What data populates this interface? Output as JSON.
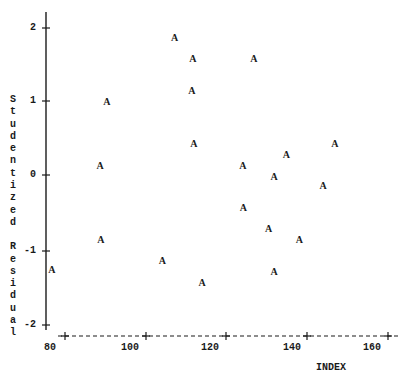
{
  "chart_data": {
    "type": "scatter",
    "title": "",
    "xlabel": "INDEX",
    "ylabel": "Studentized Residual",
    "xlim": [
      80,
      162
    ],
    "ylim": [
      -2,
      2.2
    ],
    "xticks": [
      "80",
      "100",
      "120",
      "140",
      "160"
    ],
    "yticks": [
      "2",
      "1",
      "0",
      "-1",
      "-2"
    ],
    "marker": "A",
    "grid": false,
    "legend": null,
    "series": [
      {
        "name": "A",
        "points": [
          {
            "x": 80.7,
            "y": -1.26
          },
          {
            "x": 92.6,
            "y": 0.13
          },
          {
            "x": 92.8,
            "y": -0.86
          },
          {
            "x": 94.3,
            "y": 1.0
          },
          {
            "x": 108.0,
            "y": -1.15
          },
          {
            "x": 111.0,
            "y": 1.86
          },
          {
            "x": 115.3,
            "y": 1.15
          },
          {
            "x": 115.5,
            "y": 1.58
          },
          {
            "x": 115.8,
            "y": 0.43
          },
          {
            "x": 117.8,
            "y": -1.44
          },
          {
            "x": 127.9,
            "y": 0.14
          },
          {
            "x": 128.0,
            "y": -0.43
          },
          {
            "x": 130.6,
            "y": 1.58
          },
          {
            "x": 134.2,
            "y": -0.72
          },
          {
            "x": 135.6,
            "y": -0.01
          },
          {
            "x": 135.6,
            "y": -1.29
          },
          {
            "x": 138.6,
            "y": 0.28
          },
          {
            "x": 141.8,
            "y": -0.86
          },
          {
            "x": 147.7,
            "y": -0.13
          },
          {
            "x": 150.6,
            "y": 0.43
          }
        ]
      }
    ]
  },
  "axes": {
    "ylabel_chars": [
      "S",
      "t",
      "u",
      "d",
      "e",
      "n",
      "t",
      "i",
      "z",
      "e",
      "d",
      "",
      "R",
      "e",
      "s",
      "i",
      "d",
      "u",
      "a",
      "l"
    ],
    "y_tick_labels": [
      "2",
      "1",
      "0",
      "-1",
      "-2"
    ],
    "x_tick_labels": [
      "80",
      "100",
      "120",
      "140",
      "160"
    ],
    "x_title": "INDEX"
  }
}
